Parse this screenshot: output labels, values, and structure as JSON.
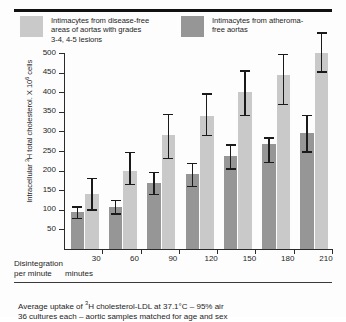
{
  "legend": {
    "entries": [
      {
        "label": "Intimacytes from disease-free\nareas of aortas with grades\n3-4, 4-5 lesions",
        "color": "#c9c9c9"
      },
      {
        "label": "Intimacytes from atheroma-\nfree aortas",
        "color": "#969696"
      }
    ]
  },
  "axis": {
    "ylabel_pre": "Intracellular ",
    "ylabel_sup": "3",
    "ylabel_mid": "H total cholesterol. X 10",
    "ylabel_sup2": "6",
    "ylabel_post": " cells",
    "xlabel_line1": "Disintegration",
    "xlabel_line2": "per minute",
    "xunits": "minutes"
  },
  "footnote": {
    "line1_pre": "Average uptake of ",
    "line1_sup": "3",
    "line1_post": "H cholesterol-LDL at 37.1°C – 95% air",
    "line2": "36 cultures each – aortic samples matched for age and sex"
  },
  "chart_data": {
    "type": "bar",
    "title": "",
    "xlabel": "Disintegration per minute (minutes)",
    "ylabel": "Intracellular 3H total cholesterol. X 10^6 cells",
    "categories": [
      "30",
      "60",
      "90",
      "120",
      "150",
      "180",
      "210"
    ],
    "ylim": [
      0,
      500
    ],
    "yticks": [
      50,
      100,
      150,
      200,
      250,
      300,
      350,
      400,
      450,
      500
    ],
    "grid": false,
    "legend_position": "above-plot",
    "series": [
      {
        "name": "Intimacytes from atheroma-free aortas",
        "color": "#969696",
        "values": [
          95,
          107,
          168,
          192,
          238,
          268,
          295
        ],
        "err_low": [
          78,
          90,
          140,
          160,
          205,
          222,
          248
        ],
        "err_high": [
          112,
          128,
          200,
          222,
          270,
          288,
          345
        ]
      },
      {
        "name": "Intimacytes from disease-free areas of aortas with grades 3-4, 4-5 lesions",
        "color": "#c9c9c9",
        "values": [
          140,
          200,
          290,
          340,
          400,
          445,
          500
        ],
        "err_low": [
          100,
          165,
          232,
          290,
          342,
          370,
          452
        ],
        "err_high": [
          185,
          250,
          348,
          400,
          458,
          500,
          555
        ]
      }
    ]
  }
}
